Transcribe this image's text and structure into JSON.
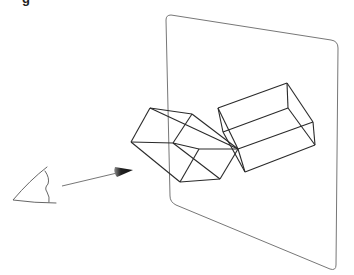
{
  "figure": {
    "heading_fragment": "g",
    "colors": {
      "background": "#ffffff",
      "plane_stroke": "#777777",
      "wire_stroke": "#2a2a2a",
      "eye_stroke": "#555555",
      "arrow_stroke": "#666666",
      "cone_fill_dark": "#111111",
      "cone_fill_light": "#8a8a8a"
    }
  }
}
